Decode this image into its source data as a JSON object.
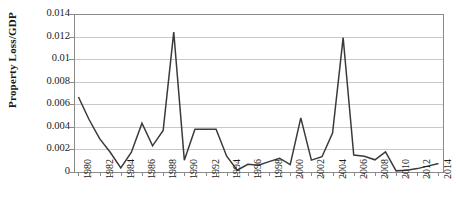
{
  "chart_data": {
    "type": "line",
    "title": "",
    "subtitle": "",
    "xlabel": "",
    "ylabel": "Property Loss/GDP",
    "xlim": [
      1980,
      2014
    ],
    "ylim": [
      0,
      0.014
    ],
    "grid": true,
    "legend": false,
    "legend_position": "none",
    "y_ticks": [
      0,
      0.002,
      0.004,
      0.006,
      0.008,
      0.01,
      0.012,
      0.014
    ],
    "y_tick_labels": [
      "0",
      "0.002",
      "0.004",
      "0.006",
      "0.008",
      "0.01",
      "0.012",
      "0.014"
    ],
    "x_ticks": [
      1980,
      1982,
      1984,
      1986,
      1988,
      1990,
      1992,
      1994,
      1996,
      1998,
      2000,
      2002,
      2004,
      2006,
      2008,
      2010,
      2012,
      2014
    ],
    "x_tick_labels": [
      "1980",
      "1982",
      "1984",
      "1986",
      "1988",
      "1990",
      "1992",
      "1994",
      "1996",
      "1998",
      "2000",
      "2002",
      "2004",
      "2006",
      "2008",
      "2010",
      "2012",
      "2014"
    ],
    "x_tick_label_rotation": -90,
    "line_color": "#3a3a3a",
    "line_width": 1.5,
    "markers": false,
    "x": [
      1980,
      1981,
      1982,
      1983,
      1984,
      1985,
      1986,
      1987,
      1988,
      1989,
      1990,
      1991,
      1992,
      1993,
      1994,
      1995,
      1996,
      1997,
      1998,
      1999,
      2000,
      2001,
      2002,
      2003,
      2004,
      2005,
      2006,
      2007,
      2008,
      2009,
      2010,
      2011,
      2012,
      2013,
      2014
    ],
    "values": [
      0.00665,
      0.00465,
      0.00295,
      0.00175,
      0.00037,
      0.00175,
      0.00432,
      0.00232,
      0.00368,
      0.0124,
      0.00105,
      0.00378,
      0.00378,
      0.00378,
      0.0014,
      0.00016,
      0.00068,
      0.0006,
      0.00092,
      0.00122,
      0.00065,
      0.0048,
      0.00105,
      0.00135,
      0.00345,
      0.0119,
      0.0015,
      0.0014,
      0.00108,
      0.00178,
      0.0001,
      0.00015,
      0.0003,
      0.00052,
      0.00075
    ],
    "series": [
      {
        "name": "Property Loss/GDP",
        "values": [
          0.00665,
          0.00465,
          0.00295,
          0.00175,
          0.00037,
          0.00175,
          0.00432,
          0.00232,
          0.00368,
          0.0124,
          0.00105,
          0.00378,
          0.00378,
          0.00378,
          0.0014,
          0.00016,
          0.00068,
          0.0006,
          0.00092,
          0.00122,
          0.00065,
          0.0048,
          0.00105,
          0.00135,
          0.00345,
          0.0119,
          0.0015,
          0.0014,
          0.00108,
          0.00178,
          0.0001,
          0.00015,
          0.0003,
          0.00052,
          0.00075
        ]
      }
    ],
    "annotations": []
  }
}
